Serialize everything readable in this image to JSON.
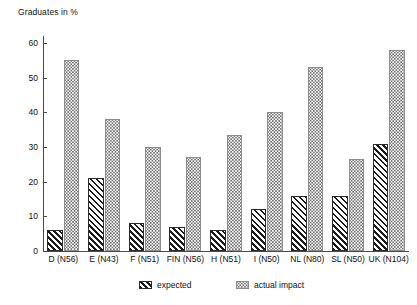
{
  "chart_data": {
    "type": "bar",
    "title": "Graduates in %",
    "xlabel": "",
    "ylabel": "Graduates in %",
    "ylim": [
      0,
      62
    ],
    "yticks": [
      0,
      10,
      20,
      30,
      40,
      50,
      60
    ],
    "ytick_labels": [
      "0",
      "10",
      "20",
      "30",
      "40",
      "50",
      "60"
    ],
    "grid": false,
    "legend_position": "below-axis",
    "categories": [
      "D (N56)",
      "E (N43)",
      "F (N51)",
      "FIN (N56)",
      "H (N51)",
      "I (N50)",
      "NL (N80)",
      "SL (N50)",
      "UK (N104)"
    ],
    "series": [
      {
        "name": "expected",
        "pattern": "diagonal-hatch",
        "values": [
          6,
          21,
          8,
          7,
          6,
          12,
          16,
          16,
          31
        ]
      },
      {
        "name": "actual impact",
        "pattern": "dotted",
        "values": [
          55,
          38,
          30,
          27,
          33.5,
          40,
          53,
          26.5,
          58
        ]
      }
    ]
  },
  "legend": {
    "items": [
      {
        "label": "expected"
      },
      {
        "label": "actual impact"
      }
    ]
  }
}
